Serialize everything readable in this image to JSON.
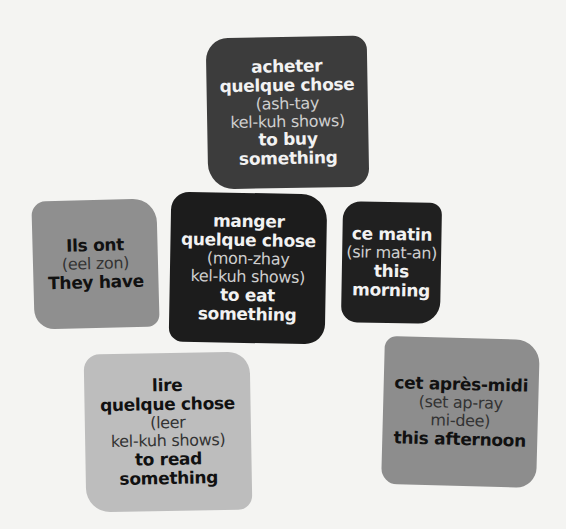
{
  "cards": {
    "acheter": {
      "french": [
        "acheter",
        "quelque chose"
      ],
      "pronunciation": [
        "(ash-tay",
        "kel-kuh shows)"
      ],
      "english": [
        "to buy",
        "something"
      ],
      "color": "#3c3c3c"
    },
    "manger": {
      "french": [
        "manger",
        "quelque chose"
      ],
      "pronunciation": [
        "(mon-zhay",
        "kel-kuh shows)"
      ],
      "english": [
        "to eat",
        "something"
      ],
      "color": "#1c1c1c"
    },
    "ils_ont": {
      "french": [
        "Ils ont"
      ],
      "pronunciation": [
        "(eel zon)"
      ],
      "english": [
        "They have"
      ],
      "color": "#8f8f8f"
    },
    "ce_matin": {
      "french": [
        "ce matin"
      ],
      "pronunciation": [
        "(sir mat-an)"
      ],
      "english": [
        "this morning"
      ],
      "color": "#202020"
    },
    "lire": {
      "french": [
        "lire",
        "quelque chose"
      ],
      "pronunciation": [
        "(leer",
        "kel-kuh shows)"
      ],
      "english": [
        "to read",
        "something"
      ],
      "color": "#bdbdbd"
    },
    "apres_midi": {
      "french": [
        "cet après-midi"
      ],
      "pronunciation": [
        "(set ap-ray",
        "mi-dee)"
      ],
      "english": [
        "this afternoon"
      ],
      "color": "#8d8d8d"
    }
  }
}
